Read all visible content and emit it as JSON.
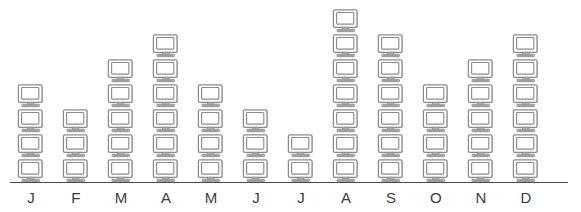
{
  "chart_data": {
    "type": "bar",
    "subtype": "pictogram",
    "title": "",
    "subtitle": "",
    "xlabel": "",
    "ylabel": "",
    "categories": [
      "J",
      "F",
      "M",
      "A",
      "M",
      "J",
      "J",
      "A",
      "S",
      "O",
      "N",
      "D"
    ],
    "category_full_names": [
      "January",
      "February",
      "March",
      "April",
      "May",
      "June",
      "July",
      "August",
      "September",
      "October",
      "November",
      "December"
    ],
    "values": [
      4,
      3,
      5,
      6,
      4,
      3,
      2,
      7,
      6,
      4,
      5,
      6
    ],
    "ylim": [
      0,
      7
    ],
    "grid": false,
    "legend": null,
    "annotations": [],
    "icon": "computer-monitor-icon",
    "icon_unit_value": 1,
    "axis": {
      "baseline": true,
      "tick_labels": [
        "J",
        "F",
        "M",
        "A",
        "M",
        "J",
        "J",
        "A",
        "S",
        "O",
        "N",
        "D"
      ]
    },
    "colors": {
      "icon_outline": "#8c8c8c",
      "icon_fill": "#ffffff",
      "icon_shadow": "#bdbdbd",
      "axis": "#4a4a4a",
      "label_text": "#3b3b3b",
      "background": "#ffffff"
    }
  }
}
